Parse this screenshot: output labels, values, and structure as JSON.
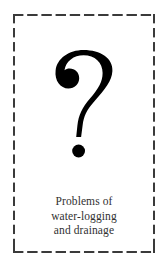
{
  "figure": {
    "name": "problems-of-water-logging-and-drainage-figure",
    "border_style": "dashed",
    "border_color": "#3a3a3a",
    "background_color": "#ffffff",
    "graphic": {
      "icon_name": "question-mark-icon",
      "glyph": "?",
      "color": "#000000",
      "description": "large bold serif question mark with detached round dot"
    },
    "caption": {
      "full_text": "Problems of water-logging and drainage",
      "text_color": "#313131",
      "lines": [
        "Problems of",
        "water-logging",
        "and drainage"
      ]
    }
  }
}
